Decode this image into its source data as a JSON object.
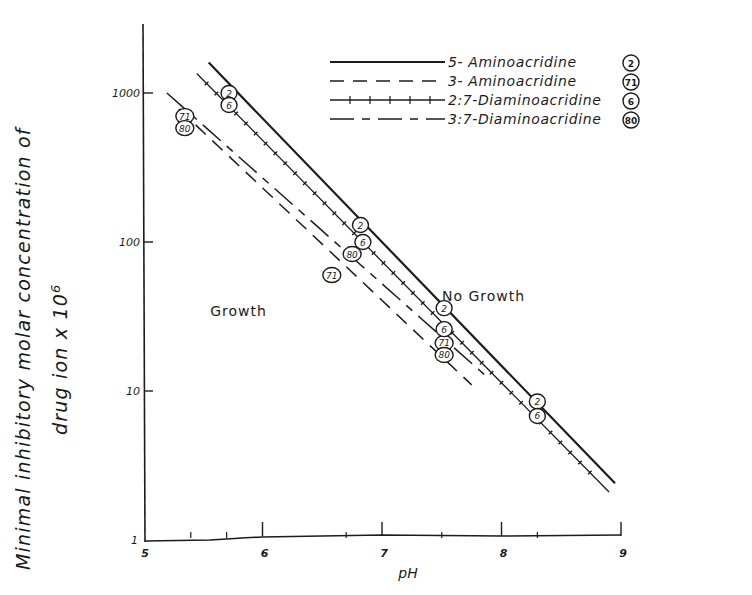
{
  "chart_data": {
    "type": "line",
    "title": "",
    "xlabel": "pH",
    "ylabel": "Minimal inhibitory molar concentration of drug ion x 10^6",
    "ylabel_line1": "Minimal inhibitory molar concentration of",
    "ylabel_line2": "drug ion x 10",
    "ylabel_sup": "6",
    "x_scale": "linear",
    "y_scale": "log",
    "xlim": [
      5,
      9
    ],
    "ylim": [
      1,
      2000
    ],
    "x_ticks": [
      "5",
      "6",
      "7",
      "8",
      "9"
    ],
    "y_ticks": [
      "1",
      "10",
      "100",
      "1000"
    ],
    "grid": false,
    "legend_position": "upper right",
    "regions": [
      {
        "label": "Growth",
        "x": 5.8,
        "y": 32
      },
      {
        "label": "No Growth",
        "x": 7.85,
        "y": 40
      }
    ],
    "series": [
      {
        "name": "5- Aminoacridine",
        "marker_label": "2",
        "style": "solid-thick",
        "line": {
          "x": [
            5.55,
            8.95
          ],
          "y": [
            1600,
            2.4
          ]
        },
        "points": [
          {
            "x": 5.72,
            "y": 1000
          },
          {
            "x": 6.82,
            "y": 130
          },
          {
            "x": 7.52,
            "y": 36
          },
          {
            "x": 8.3,
            "y": 8.5
          }
        ]
      },
      {
        "name": "3- Aminoacridine",
        "marker_label": "71",
        "style": "dashed",
        "line": {
          "x": [
            5.3,
            7.75
          ],
          "y": [
            780,
            11
          ]
        },
        "points": [
          {
            "x": 5.35,
            "y": 700
          },
          {
            "x": 6.58,
            "y": 60
          },
          {
            "x": 7.52,
            "y": 21
          }
        ]
      },
      {
        "name": "2:7-Diaminoacridine",
        "marker_label": "6",
        "style": "solid-ticked",
        "line": {
          "x": [
            5.45,
            8.9
          ],
          "y": [
            1350,
            2.1
          ]
        },
        "points": [
          {
            "x": 5.72,
            "y": 880
          },
          {
            "x": 6.84,
            "y": 100
          },
          {
            "x": 7.52,
            "y": 26
          },
          {
            "x": 8.3,
            "y": 6.8
          }
        ]
      },
      {
        "name": "3:7-Diaminoacridine",
        "marker_label": "80",
        "style": "dash-long-short",
        "line": {
          "x": [
            5.2,
            7.9
          ],
          "y": [
            1000,
            12
          ]
        },
        "points": [
          {
            "x": 5.35,
            "y": 820
          },
          {
            "x": 6.75,
            "y": 100
          },
          {
            "x": 7.52,
            "y": 19
          }
        ]
      }
    ]
  }
}
